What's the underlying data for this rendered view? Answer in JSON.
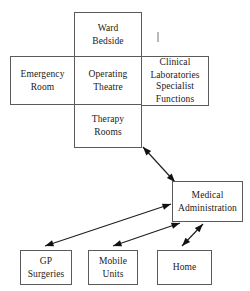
{
  "diagram": {
    "type": "block-diagram",
    "background_color": "#ffffff",
    "box_border_color": "#5a5a5a",
    "arrow_color": "#111111",
    "nodes": [
      {
        "id": "ward-bedside",
        "lines": [
          "Ward",
          "Bedside"
        ],
        "x": 74,
        "y": 12,
        "w": 68,
        "h": 45
      },
      {
        "id": "emergency-room",
        "lines": [
          "Emergency",
          "Room"
        ],
        "x": 10,
        "y": 56,
        "w": 65,
        "h": 49
      },
      {
        "id": "operating-theatre",
        "lines": [
          "Operating",
          "Theatre"
        ],
        "x": 74,
        "y": 56,
        "w": 68,
        "h": 49
      },
      {
        "id": "clinical-laboratories",
        "lines": [
          "Clinical",
          "Laboratories"
        ],
        "x": 141,
        "y": 56,
        "w": 68,
        "h": 26
      },
      {
        "id": "specialist-functions",
        "lines": [
          "Specialist",
          "Functions"
        ],
        "x": 141,
        "y": 81,
        "w": 68,
        "h": 25
      },
      {
        "id": "therapy-rooms",
        "lines": [
          "Therapy",
          "Rooms"
        ],
        "x": 74,
        "y": 104,
        "w": 68,
        "h": 44
      },
      {
        "id": "medical-administration",
        "lines": [
          "Medical",
          "Administration"
        ],
        "x": 172,
        "y": 181,
        "w": 71,
        "h": 41
      },
      {
        "id": "gp-surgeries",
        "lines": [
          "GP",
          "Surgeries"
        ],
        "x": 20,
        "y": 250,
        "w": 52,
        "h": 35
      },
      {
        "id": "mobile-units",
        "lines": [
          "Mobile",
          "Units"
        ],
        "x": 88,
        "y": 250,
        "w": 50,
        "h": 35
      },
      {
        "id": "home",
        "lines": [
          "Home"
        ],
        "x": 157,
        "y": 250,
        "w": 55,
        "h": 35
      }
    ],
    "connectors": [
      {
        "id": "therapy-to-admin",
        "from": "therapy-rooms",
        "to": "medical-administration",
        "x1": 143,
        "y1": 147,
        "x2": 175,
        "y2": 182,
        "double_headed": true
      },
      {
        "id": "admin-to-gp-surgeries",
        "from": "medical-administration",
        "to": "gp-surgeries",
        "x1": 171,
        "y1": 204,
        "x2": 45,
        "y2": 246,
        "double_headed": true
      },
      {
        "id": "admin-to-mobile-units",
        "from": "medical-administration",
        "to": "mobile-units",
        "x1": 180,
        "y1": 223,
        "x2": 113,
        "y2": 246,
        "double_headed": true
      },
      {
        "id": "admin-to-home",
        "from": "medical-administration",
        "to": "home",
        "x1": 203,
        "y1": 224,
        "x2": 182,
        "y2": 246,
        "double_headed": true
      }
    ],
    "artifact_marks": [
      {
        "id": "scan-speck",
        "x": 157,
        "y": 32,
        "w": 2,
        "h": 10
      }
    ]
  }
}
